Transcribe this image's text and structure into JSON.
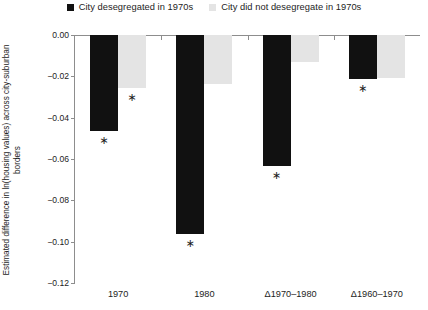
{
  "chart_data": {
    "type": "bar",
    "title": "",
    "subtitle": "",
    "xlabel": "",
    "ylabel": "Estimated difference in ln(housing values) across city-suburban borders",
    "categories": [
      "1970",
      "1980",
      "Δ1970–1980",
      "Δ1960–1970"
    ],
    "series": [
      {
        "name": "City desegregated in 1970s",
        "color": "#111111",
        "values": [
          -0.0465,
          -0.0965,
          -0.0635,
          -0.0215
        ],
        "significant": [
          true,
          true,
          true,
          true
        ]
      },
      {
        "name": "City did not desegregate in 1970s",
        "color": "#e4e4e4",
        "values": [
          -0.0255,
          -0.0235,
          -0.013,
          -0.021
        ],
        "significant": [
          true,
          false,
          false,
          false
        ]
      }
    ],
    "ylim": [
      -0.12,
      0.0
    ],
    "ytick_values": [
      0.0,
      -0.02,
      -0.04,
      -0.06,
      -0.08,
      -0.1,
      -0.12
    ],
    "ytick_labels": [
      "0.00",
      "−0.02",
      "−0.04",
      "−0.06",
      "−0.08",
      "−0.10",
      "−0.12"
    ],
    "grid": false,
    "legend_position": "top-center",
    "significance_marker": "∗"
  },
  "legend": {
    "items": [
      {
        "label": "City desegregated in 1970s",
        "swatch": "#111111"
      },
      {
        "label": "City did not desegregate in 1970s",
        "swatch": "#e4e4e4"
      }
    ]
  },
  "axes": {
    "y_title": "Estimated difference in ln(housing values) across city-suburban borders"
  }
}
